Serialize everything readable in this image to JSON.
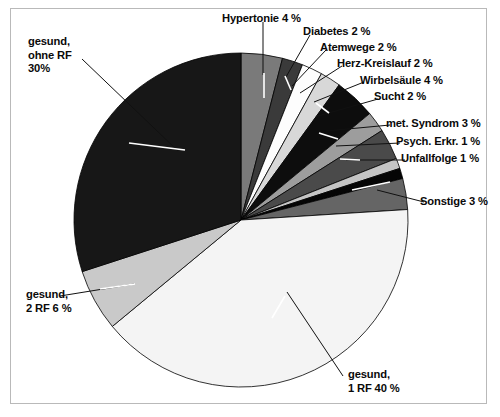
{
  "figure": {
    "title": "",
    "frame_color": "#b9b9b9",
    "background": "#ffffff"
  },
  "labels": {
    "hypertonie": "Hypertonie 4 %",
    "diabetes": "Diabetes 2 %",
    "atemwege": "Atemwege 2 %",
    "herz_kreislauf": "Herz-Kreislauf 2 %",
    "wirbelsaeule": "Wirbelsäule 4 %",
    "sucht": "Sucht 2 %",
    "met_syndrom": "met. Syndrom 3 %",
    "psych_erkr": "Psych. Erkr. 1 %",
    "unfallfolge": "Unfallfolge 1 %",
    "sonstige": "Sonstige 3 %",
    "gesund_ohne_rf": "gesund,\nohne RF\n30%",
    "gesund_2rf": "gesund,\n2 RF 6 %",
    "gesund_1rf": "gesund,\n1 RF 40 %"
  },
  "chart_data": {
    "type": "pie",
    "title": "",
    "xlabel": "",
    "ylabel": "",
    "legend_position": "none",
    "grid": false,
    "units": "percent",
    "start_angle_deg": 0,
    "direction": "clockwise",
    "total": 100,
    "categories": [
      "Hypertonie",
      "Diabetes",
      "Atemwege",
      "Herz-Kreislauf",
      "Wirbelsäule",
      "Sucht",
      "met. Syndrom",
      "Psych. Erkr.",
      "Unfallfolge",
      "Sonstige",
      "gesund, 1 RF",
      "gesund, 2 RF",
      "gesund, ohne RF"
    ],
    "values": [
      4,
      2,
      2,
      2,
      4,
      2,
      3,
      1,
      1,
      3,
      40,
      6,
      30
    ],
    "labels": [
      "Hypertonie 4 %",
      "Diabetes 2 %",
      "Atemwege 2 %",
      "Herz-Kreislauf 2 %",
      "Wirbelsäule 4 %",
      "Sucht 2 %",
      "met. Syndrom 3 %",
      "Psych. Erkr. 1 %",
      "Unfallfolge 1 %",
      "Sonstige 3 %",
      "gesund, 1 RF 40 %",
      "gesund, 2 RF 6 %",
      "gesund, ohne RF 30%"
    ],
    "colors": [
      "#7a7a7a",
      "#3a3a3a",
      "#fdfdfd",
      "#d8d8d8",
      "#0d0d0d",
      "#9d9d9d",
      "#4a4a4a",
      "#c4c4c4",
      "#050505",
      "#656565",
      "#f4f4f4",
      "#c9c9c9",
      "#171717"
    ]
  },
  "geometry": {
    "center_x": 241,
    "center_y": 220,
    "radius": 167
  }
}
